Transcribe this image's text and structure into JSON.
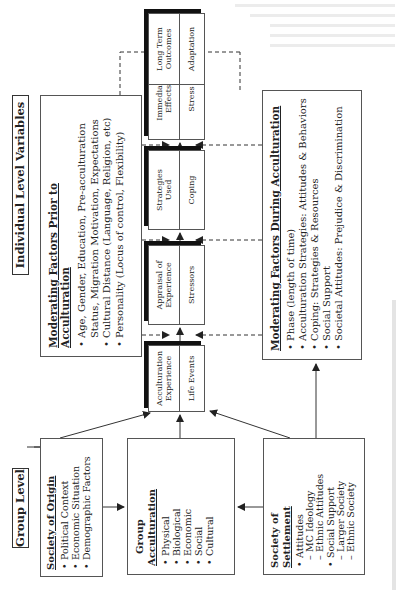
{
  "group_level": {
    "label": "Group Level",
    "society_of_origin": {
      "title": "Society of Origin",
      "items": [
        "Political Context",
        "Economic Situation",
        "Demographic Factors"
      ]
    },
    "group_acculturation": {
      "title_line1": "Group",
      "title_line2": "Acculturation",
      "items": [
        "Physical",
        "Biological",
        "Economic",
        "Social",
        "Cultural"
      ]
    },
    "society_of_settlement": {
      "title_line1": "Society of",
      "title_line2": "Settlement",
      "items": [
        {
          "text": "Attitudes",
          "level": 1
        },
        {
          "text": "MC Ideology",
          "level": 2
        },
        {
          "text": "Ethnic Attitudes",
          "level": 2
        },
        {
          "text": "Social Support",
          "level": 1
        },
        {
          "text": "Larger Society",
          "level": 2
        },
        {
          "text": "Ethnic Society",
          "level": 2
        }
      ]
    }
  },
  "individual_level": {
    "label": "Individual Level Variables",
    "moderating_prior": {
      "title": "Moderating Factors Prior to Acculturation",
      "items": [
        "Age, Gender, Education, Pre-acculturation",
        "Status, Migration Motivation, Expectations",
        "Cultural Distance (Language, Religion, etc)",
        "Personality (Locus of control, Flexibility)"
      ]
    },
    "chain": [
      {
        "top_line1": "Acculturation",
        "top_line2": "Experience",
        "bottom": "Life Events"
      },
      {
        "top_line1": "Appraisal of",
        "top_line2": "Experience",
        "bottom": "Stressors"
      },
      {
        "top_line1": "Strategies",
        "top_line2": "Used",
        "bottom": "Coping"
      },
      {
        "top_line1": "Immediate",
        "top_line2": "Effects",
        "bottom": "Stress"
      },
      {
        "top_line1": "Long Term",
        "top_line2": "Outcomes",
        "bottom": "Adaptation"
      }
    ],
    "moderating_during": {
      "title": "Moderating Factors During Acculturation",
      "items": [
        "Phase (length of time)",
        "Acculturation Strategies: Attitudes & Behaviors",
        "Coping: Strategies & Resources",
        "Social Support",
        "Societal Attitudes: Prejudice & Discrimination"
      ]
    }
  },
  "colors": {
    "line": "#333333",
    "box_border": "#555555",
    "shadow": "#111111",
    "background": "#ffffff"
  }
}
